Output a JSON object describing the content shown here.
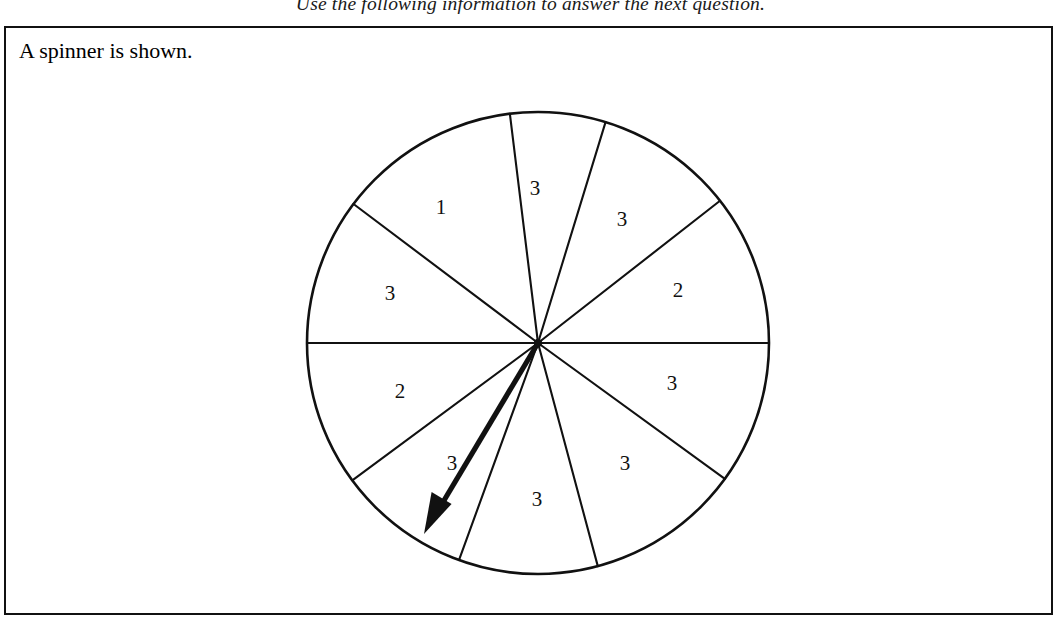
{
  "header": {
    "instruction": "Use the following information to answer the next question."
  },
  "content": {
    "caption": "A spinner is shown."
  },
  "figure": {
    "name": "spinner",
    "center": {
      "x": 538,
      "y": 343
    },
    "radius": 231,
    "stroke_color": "#111111",
    "fill_color": "#ffffff",
    "pointer": {
      "name": "spinner-arrow",
      "from": {
        "x": 538,
        "y": 343
      },
      "to": {
        "x": 424,
        "y": 534
      },
      "angle_deg": -120.8,
      "color": "#111111"
    },
    "sectors": [
      {
        "label": "3",
        "start_deg": 73,
        "end_deg": 97,
        "label_x": 535,
        "label_y": 195
      },
      {
        "label": "1",
        "start_deg": 97,
        "end_deg": 143,
        "label_x": 441,
        "label_y": 214
      },
      {
        "label": "3",
        "start_deg": 143,
        "end_deg": 180,
        "label_x": 390,
        "label_y": 300
      },
      {
        "label": "2",
        "start_deg": 180,
        "end_deg": 216.5,
        "label_x": 400,
        "label_y": 398
      },
      {
        "label": "3",
        "start_deg": 216.5,
        "end_deg": 250,
        "label_x": 452,
        "label_y": 470
      },
      {
        "label": "3",
        "start_deg": 250,
        "end_deg": 285,
        "label_x": 537,
        "label_y": 506
      },
      {
        "label": "3",
        "start_deg": 285,
        "end_deg": 324,
        "label_x": 625,
        "label_y": 470
      },
      {
        "label": "3",
        "start_deg": 324,
        "end_deg": 360,
        "label_x": 672,
        "label_y": 390
      },
      {
        "label": "2",
        "start_deg": 0,
        "end_deg": 38,
        "label_x": 678,
        "label_y": 297
      },
      {
        "label": "3",
        "start_deg": 38,
        "end_deg": 73,
        "label_x": 622,
        "label_y": 226
      }
    ]
  },
  "chart_data": {
    "type": "pie",
    "title": "Spinner",
    "categories": [
      "1",
      "2",
      "3"
    ],
    "values": [
      1,
      2,
      7
    ],
    "labels_in_order_ccw_from_top": [
      "3",
      "1",
      "3",
      "2",
      "3",
      "3",
      "3",
      "3",
      "2",
      "3"
    ],
    "total_sectors": 10,
    "legend": "none",
    "grid": false
  }
}
